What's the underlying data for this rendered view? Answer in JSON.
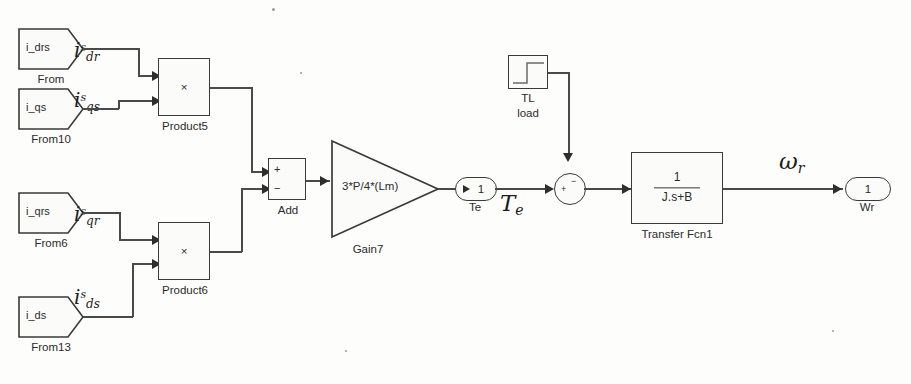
{
  "diagram": {
    "type": "simulink-block-diagram"
  },
  "from_blocks": [
    {
      "tag": "i_drs",
      "name": "From",
      "signal_main": "i",
      "signal_sup": "s",
      "signal_sub": "dr"
    },
    {
      "tag": "i_qs",
      "name": "From10",
      "signal_main": "i",
      "signal_sup": "s",
      "signal_sub": "qs"
    },
    {
      "tag": "i_qrs",
      "name": "From6",
      "signal_main": "i",
      "signal_sup": "s",
      "signal_sub": "qr"
    },
    {
      "tag": "i_ds",
      "name": "From13",
      "signal_main": "i",
      "signal_sup": "s",
      "signal_sub": "ds"
    }
  ],
  "products": [
    {
      "name": "Product5",
      "symbol": "×"
    },
    {
      "name": "Product6",
      "symbol": "×"
    }
  ],
  "add_block": {
    "name": "Add",
    "sign_top": "+",
    "sign_bottom": "−"
  },
  "gain": {
    "name": "Gain7",
    "expression": "3*P/4*(Lm)"
  },
  "te_port": {
    "number": "1",
    "name": "Te",
    "signal_main": "T",
    "signal_sub": "e"
  },
  "step": {
    "name_line1": "TL",
    "name_line2": "load"
  },
  "sum_junction": {
    "name": "Sum",
    "sign_left": "+",
    "sign_top": "−"
  },
  "transfer_fcn": {
    "name": "Transfer Fcn1",
    "numerator": "1",
    "denominator": "J.s+B"
  },
  "wr_port": {
    "number": "1",
    "name": "Wr",
    "signal_main": "ω",
    "signal_sub": "r"
  }
}
